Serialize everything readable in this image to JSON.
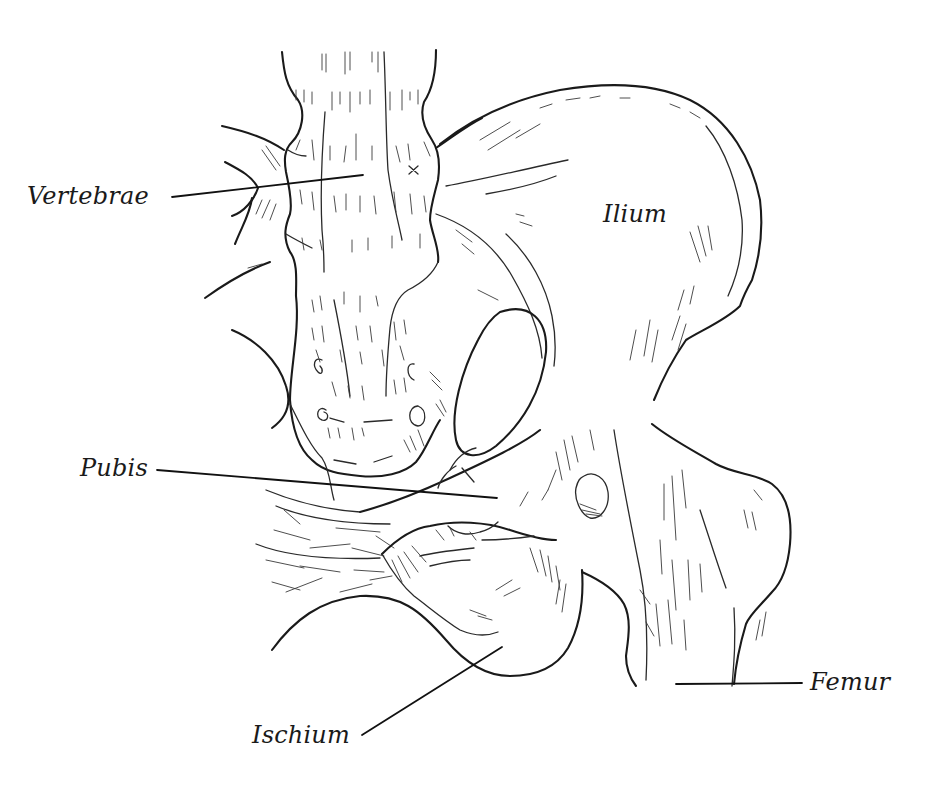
{
  "figure": {
    "background": "#ffffff",
    "ink": "#1a1a1a"
  },
  "labels": [
    {
      "id": "vertebrae",
      "text": "Vertebrae",
      "x": 27,
      "y": 184,
      "leader": [
        172,
        197,
        363,
        175
      ]
    },
    {
      "id": "ilium",
      "text": "Ilium",
      "x": 603,
      "y": 202,
      "leader": null
    },
    {
      "id": "pubis",
      "text": "Pubis",
      "x": 80,
      "y": 456,
      "leader": [
        157,
        470,
        497,
        498
      ]
    },
    {
      "id": "ischium",
      "text": "Ischium",
      "x": 252,
      "y": 729,
      "leader": [
        362,
        735,
        502,
        647
      ]
    },
    {
      "id": "femur",
      "text": "Femur",
      "x": 810,
      "y": 667,
      "leader": [
        676,
        684,
        802,
        683
      ]
    }
  ]
}
